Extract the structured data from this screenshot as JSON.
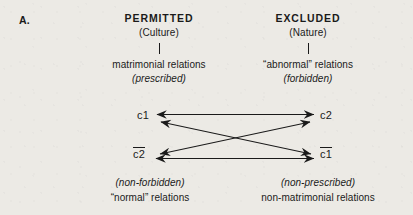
{
  "figure": {
    "panel_label": "A.",
    "columns": [
      {
        "title": "PERMITTED",
        "subtitle": "(Culture)",
        "connector": "vertical-line",
        "line1": "matrimonial relations",
        "line2": "(prescribed)"
      },
      {
        "title": "EXCLUDED",
        "subtitle": "(Nature)",
        "connector": "vertical-line",
        "line1": "“abnormal” relations",
        "line2": "(forbidden)"
      }
    ],
    "nodes": {
      "top_left": {
        "label": "c1",
        "negated": false
      },
      "top_right": {
        "label": "c2",
        "negated": false
      },
      "bottom_left": {
        "label": "c2",
        "negated": true
      },
      "bottom_right": {
        "label": "c1",
        "negated": true
      }
    },
    "captions": [
      {
        "italic": "(non-forbidden)",
        "plain": "“normal” relations"
      },
      {
        "italic": "(non-prescribed)",
        "plain": "non-matrimonial relations"
      }
    ],
    "edges": [
      {
        "name": "top-horizontal",
        "from": "c1",
        "to": "c2",
        "style": "double-headed"
      },
      {
        "name": "bottom-horizontal",
        "from": "non-c2",
        "to": "non-c1",
        "style": "double-headed"
      },
      {
        "name": "diagonal-c1-to-non-c1",
        "from": "c1",
        "to": "non-c1",
        "style": "double-headed"
      },
      {
        "name": "diagonal-c2-to-non-c2",
        "from": "c2",
        "to": "non-c2",
        "style": "double-headed"
      }
    ],
    "colors": {
      "ink": "#1a1a1a",
      "paper": "#eceae5"
    }
  }
}
